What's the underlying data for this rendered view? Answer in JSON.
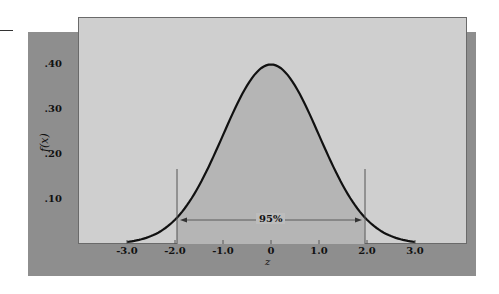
{
  "chart_data": {
    "type": "area",
    "title": "",
    "xlabel": "z",
    "ylabel": "f(x)",
    "x_ticks": [
      "-3.0",
      "-2.0",
      "-1.0",
      "0",
      "1.0",
      "2.0",
      "3.0"
    ],
    "y_ticks": [
      ".10",
      ".20",
      ".30",
      ".40"
    ],
    "xlim": [
      -3.0,
      3.0
    ],
    "ylim": [
      0,
      0.45
    ],
    "grid": false,
    "legend": null,
    "series": [
      {
        "name": "Standard normal density",
        "x": [
          -3.0,
          -2.5,
          -2.0,
          -1.96,
          -1.5,
          -1.0,
          -0.5,
          0,
          0.5,
          1.0,
          1.5,
          1.96,
          2.0,
          2.5,
          3.0
        ],
        "values": [
          0.004,
          0.018,
          0.054,
          0.058,
          0.13,
          0.242,
          0.352,
          0.399,
          0.352,
          0.242,
          0.13,
          0.058,
          0.054,
          0.018,
          0.004
        ]
      }
    ],
    "shaded_region": {
      "from": -1.96,
      "to": 1.96,
      "label": "95%"
    },
    "annotations": [
      {
        "text": "95%",
        "type": "double-arrow",
        "x_from": -1.96,
        "x_to": 1.96,
        "y": 0.07
      }
    ]
  },
  "labels": {
    "ylabel": "f(x)",
    "xlabel": "z",
    "annotation": "95%",
    "yticks": [
      ".40",
      ".30",
      ".20",
      ".10"
    ],
    "xticks": [
      "-3.0",
      "-2.0",
      "-1.0",
      "0",
      "1.0",
      "2.0",
      "3.0"
    ]
  },
  "colors": {
    "panel": "#8e8e8e",
    "plot_background": "#cfcfcf",
    "shaded_area": "#b5b5b5",
    "curve": "#111111"
  }
}
